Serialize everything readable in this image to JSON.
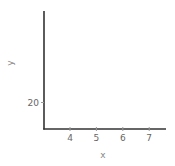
{
  "chart_data": {
    "type": "scatter",
    "title": "",
    "xlabel": "x",
    "ylabel": "y",
    "xlim": [
      3.0,
      7.7
    ],
    "ylim": [
      10,
      54
    ],
    "xticks": [
      4,
      5,
      6,
      7
    ],
    "yticks": [
      20,
      30,
      40,
      50
    ],
    "grid": false,
    "legend": null,
    "series": [
      {
        "name": "points",
        "x": [
          3.65
        ],
        "y": [
          24.5
        ],
        "color": "#222222"
      }
    ]
  }
}
